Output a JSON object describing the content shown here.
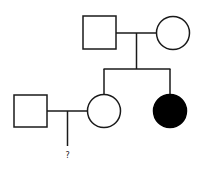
{
  "diagram": {
    "type": "pedigree-chart",
    "colors": {
      "stroke": "#1a1a1a",
      "unaffected_fill": "#ffffff",
      "affected_fill": "#000000",
      "background": "#ffffff"
    },
    "generations": [
      {
        "level": 1,
        "individuals": [
          {
            "id": "I-1",
            "sex": "male",
            "shape": "square",
            "affected": false
          },
          {
            "id": "I-2",
            "sex": "female",
            "shape": "circle",
            "affected": false
          }
        ]
      },
      {
        "level": 2,
        "individuals": [
          {
            "id": "II-spouse",
            "sex": "male",
            "shape": "square",
            "affected": false,
            "married_in": true
          },
          {
            "id": "II-1",
            "sex": "female",
            "shape": "circle",
            "affected": false
          },
          {
            "id": "II-2",
            "sex": "female",
            "shape": "circle",
            "affected": true
          }
        ]
      },
      {
        "level": 3,
        "individuals": [
          {
            "id": "III-?",
            "sex": "unknown",
            "shape": "none",
            "affected": null,
            "label": "?"
          }
        ]
      }
    ],
    "relationships": [
      {
        "type": "mating",
        "between": [
          "I-1",
          "I-2"
        ],
        "children": [
          "II-1",
          "II-2"
        ]
      },
      {
        "type": "mating",
        "between": [
          "II-spouse",
          "II-1"
        ],
        "children": [
          "III-?"
        ]
      }
    ],
    "unknown_offspring_label": "?"
  }
}
